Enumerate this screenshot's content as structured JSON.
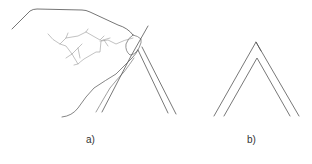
{
  "figure": {
    "panels": [
      {
        "id": "a",
        "label": "a)",
        "description": "hand pinching folded strip"
      },
      {
        "id": "b",
        "label": "b)",
        "description": "folded double-line strip"
      }
    ],
    "colors": {
      "stroke": "#555555",
      "stroke_light": "#888888",
      "background": "#ffffff"
    }
  }
}
